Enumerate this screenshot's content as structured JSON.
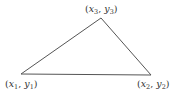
{
  "diagram": {
    "type": "triangle",
    "stroke_color": "#555555",
    "vertices": [
      {
        "id": "v1",
        "label_var_x": "x",
        "label_sub_x": "1",
        "label_var_y": "y",
        "label_sub_y": "1",
        "x": 21,
        "y": 74
      },
      {
        "id": "v2",
        "label_var_x": "x",
        "label_sub_x": "2",
        "label_var_y": "y",
        "label_sub_y": "2",
        "x": 151,
        "y": 75
      },
      {
        "id": "v3",
        "label_var_x": "x",
        "label_sub_x": "3",
        "label_var_y": "y",
        "label_sub_y": "3",
        "x": 101,
        "y": 18
      }
    ],
    "punct": {
      "open": "(",
      "comma": ", ",
      "close": ")"
    }
  }
}
